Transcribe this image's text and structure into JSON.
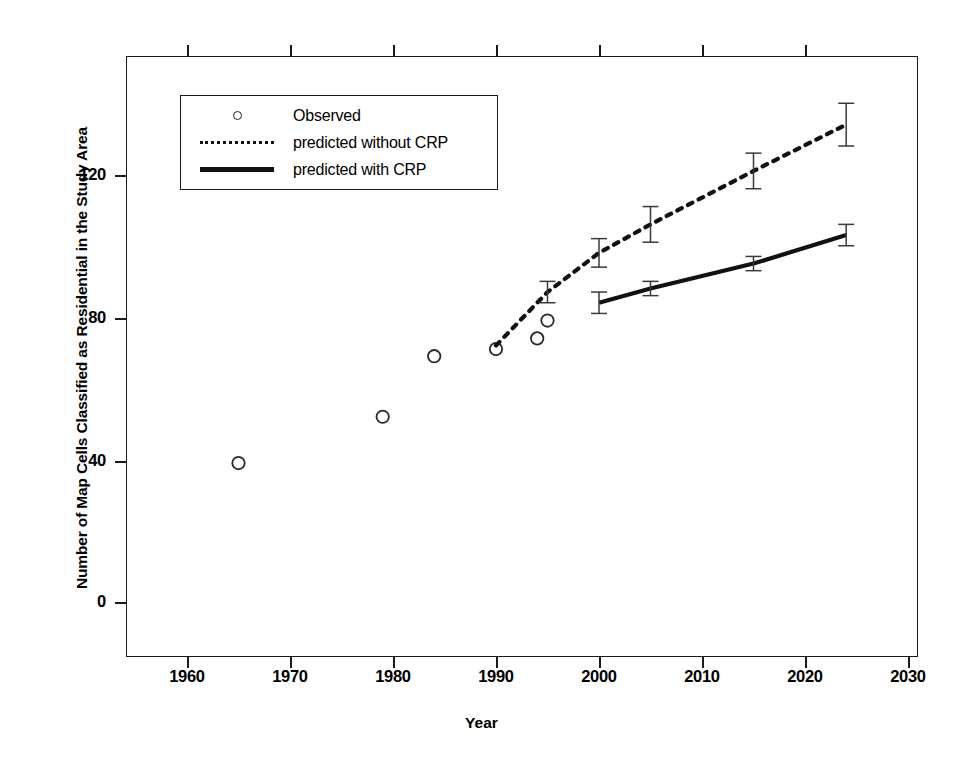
{
  "chart_data": {
    "type": "scatter",
    "title": "",
    "xlabel": "Year",
    "ylabel": "Number of Map Cells Classified as Residential in the Study Area",
    "xlim": [
      1954,
      2031
    ],
    "ylim": [
      -17,
      152
    ],
    "xticks": [
      1960,
      1970,
      1980,
      1990,
      2000,
      2010,
      2020,
      2030
    ],
    "xticklabels": [
      "1960",
      "1970",
      "1980",
      "1990",
      "2000",
      "2010",
      "2020",
      "2030"
    ],
    "yticks": [
      0,
      40,
      80,
      120
    ],
    "yticklabels": [
      "0",
      "40",
      "80",
      "120"
    ],
    "grid": false,
    "legend_position": "upper left",
    "series": [
      {
        "name": "Observed",
        "marker": "open-circle",
        "style": "points",
        "points": [
          {
            "x": 1965,
            "y": 39
          },
          {
            "x": 1979,
            "y": 52
          },
          {
            "x": 1984,
            "y": 69
          },
          {
            "x": 1990,
            "y": 71
          },
          {
            "x": 1994,
            "y": 74
          },
          {
            "x": 1995,
            "y": 79
          }
        ]
      },
      {
        "name": "predicted without CRP",
        "style": "dashed-line",
        "points": [
          {
            "x": 1990,
            "y": 72,
            "err": 0
          },
          {
            "x": 1995,
            "y": 87,
            "err": 3
          },
          {
            "x": 2000,
            "y": 98,
            "err": 4
          },
          {
            "x": 2005,
            "y": 106,
            "err": 5
          },
          {
            "x": 2015,
            "y": 121,
            "err": 5
          },
          {
            "x": 2024,
            "y": 134,
            "err": 6
          }
        ]
      },
      {
        "name": "predicted with CRP",
        "style": "solid-line",
        "points": [
          {
            "x": 2000,
            "y": 84,
            "err": 3
          },
          {
            "x": 2005,
            "y": 88,
            "err": 2
          },
          {
            "x": 2015,
            "y": 95,
            "err": 2
          },
          {
            "x": 2024,
            "y": 103,
            "err": 3
          }
        ]
      }
    ]
  },
  "axes": {
    "x_title": "Year",
    "y_title": "Number of Map Cells Classified as Residential in the Study Area",
    "x_tick_labels": [
      "1960",
      "1970",
      "1980",
      "1990",
      "2000",
      "2010",
      "2020",
      "2030"
    ],
    "y_tick_labels": [
      "120",
      "80",
      "40",
      "0"
    ]
  },
  "legend": {
    "entries": [
      {
        "label": "Observed",
        "key": "open-circle-marker"
      },
      {
        "label": "predicted without CRP",
        "key": "dashed-line-swatch"
      },
      {
        "label": "predicted with CRP",
        "key": "solid-line-swatch"
      }
    ]
  },
  "colors": {
    "ink": "#111111",
    "marker_stroke": "#2a2a2a",
    "background": "#ffffff"
  }
}
